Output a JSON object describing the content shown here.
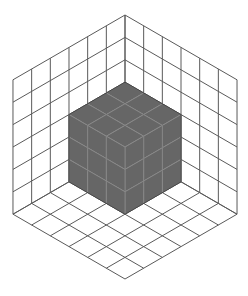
{
  "diagram": {
    "type": "isometric-corner-with-cube",
    "grid_size": 6,
    "cube_size": 3,
    "colors": {
      "background": "#ffffff",
      "grid_line": "#5a5a5a",
      "cube_face": "#666666",
      "cubelet_bevel": "#8a8a8a"
    },
    "geometry": {
      "corner": [
        125,
        15
      ],
      "left_unit": [
        -18.67,
        10.8
      ],
      "right_unit": [
        18.67,
        10.8
      ],
      "down_unit": [
        0,
        22.4
      ]
    }
  }
}
